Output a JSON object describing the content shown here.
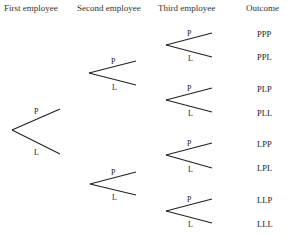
{
  "headers": {
    "first": "First employee",
    "second": "Second employee",
    "third": "Third employee",
    "outcome": "Outcome"
  },
  "branch_labels": {
    "upper": "P",
    "lower": "L"
  },
  "tree": {
    "root": {
      "x": 12,
      "y": 130,
      "upper_end": [
        60,
        109
      ],
      "lower_end": [
        60,
        154
      ]
    },
    "second_level": [
      {
        "node": [
          89,
          73
        ],
        "upper_end": [
          136,
          61
        ],
        "lower_end": [
          136,
          85
        ]
      },
      {
        "node": [
          90,
          184
        ],
        "upper_end": [
          136,
          172
        ],
        "lower_end": [
          136,
          195
        ]
      }
    ],
    "third_level": [
      {
        "node": [
          166,
          45
        ],
        "upper_end": [
          212,
          33
        ],
        "lower_end": [
          212,
          57
        ]
      },
      {
        "node": [
          166,
          100
        ],
        "upper_end": [
          212,
          88
        ],
        "lower_end": [
          212,
          112
        ]
      },
      {
        "node": [
          166,
          155
        ],
        "upper_end": [
          212,
          143
        ],
        "lower_end": [
          212,
          168
        ]
      },
      {
        "node": [
          166,
          211
        ],
        "upper_end": [
          212,
          199
        ],
        "lower_end": [
          212,
          223
        ]
      }
    ]
  },
  "outcomes": [
    "PPP",
    "PPL",
    "PLP",
    "PLL",
    "LPP",
    "LPL",
    "LLP",
    "LLL"
  ]
}
